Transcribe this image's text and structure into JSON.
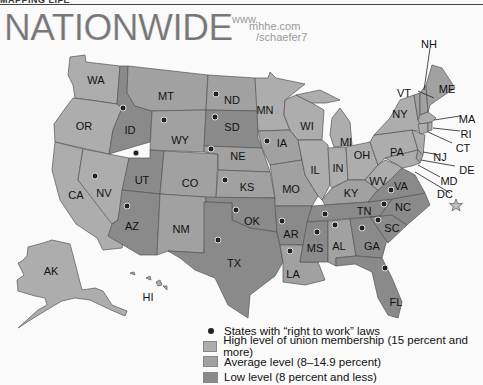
{
  "header": {
    "section_label": "MAPPING LIFE",
    "title": "NATIONWIDE",
    "url_line1": "www.",
    "url_line2": "mhhe.com",
    "url_line3": "/schaefer7"
  },
  "colors": {
    "high": "#adadad",
    "average": "#a1a1a1",
    "low": "#8a8a8a",
    "right_to_work_dot": "#222222"
  },
  "states": {
    "WA": {
      "label": "WA",
      "level": "high",
      "rtw": false
    },
    "OR": {
      "label": "OR",
      "level": "high",
      "rtw": false
    },
    "CA": {
      "label": "CA",
      "level": "high",
      "rtw": false
    },
    "NV": {
      "label": "NV",
      "level": "high",
      "rtw": true
    },
    "ID": {
      "label": "ID",
      "level": "low",
      "rtw": true
    },
    "MT": {
      "label": "MT",
      "level": "average",
      "rtw": false
    },
    "WY": {
      "label": "WY",
      "level": "average",
      "rtw": true
    },
    "UT": {
      "label": "UT",
      "level": "low",
      "rtw": true
    },
    "AZ": {
      "label": "AZ",
      "level": "low",
      "rtw": true
    },
    "CO": {
      "label": "CO",
      "level": "average",
      "rtw": false
    },
    "NM": {
      "label": "NM",
      "level": "average",
      "rtw": false
    },
    "ND": {
      "label": "ND",
      "level": "average",
      "rtw": true
    },
    "SD": {
      "label": "SD",
      "level": "low",
      "rtw": true
    },
    "NE": {
      "label": "NE",
      "level": "average",
      "rtw": true
    },
    "KS": {
      "label": "KS",
      "level": "average",
      "rtw": true
    },
    "OK": {
      "label": "OK",
      "level": "low",
      "rtw": true
    },
    "TX": {
      "label": "TX",
      "level": "low",
      "rtw": true
    },
    "MN": {
      "label": "MN",
      "level": "high",
      "rtw": false
    },
    "IA": {
      "label": "IA",
      "level": "average",
      "rtw": true
    },
    "MO": {
      "label": "MO",
      "level": "average",
      "rtw": false
    },
    "AR": {
      "label": "AR",
      "level": "low",
      "rtw": true
    },
    "LA": {
      "label": "LA",
      "level": "average",
      "rtw": true
    },
    "WI": {
      "label": "WI",
      "level": "high",
      "rtw": false
    },
    "IL": {
      "label": "IL",
      "level": "high",
      "rtw": false
    },
    "MI": {
      "label": "MI",
      "level": "high",
      "rtw": false
    },
    "IN": {
      "label": "IN",
      "level": "high",
      "rtw": false
    },
    "OH": {
      "label": "OH",
      "level": "high",
      "rtw": false
    },
    "KY": {
      "label": "KY",
      "level": "average",
      "rtw": false
    },
    "TN": {
      "label": "TN",
      "level": "low",
      "rtw": true
    },
    "MS": {
      "label": "MS",
      "level": "low",
      "rtw": true
    },
    "AL": {
      "label": "AL",
      "level": "average",
      "rtw": true
    },
    "GA": {
      "label": "GA",
      "level": "low",
      "rtw": true
    },
    "FL": {
      "label": "FL",
      "level": "low",
      "rtw": true
    },
    "SC": {
      "label": "SC",
      "level": "low",
      "rtw": true
    },
    "NC": {
      "label": "NC",
      "level": "low",
      "rtw": true
    },
    "VA": {
      "label": "VA",
      "level": "low",
      "rtw": true
    },
    "WV": {
      "label": "WV",
      "level": "high",
      "rtw": false
    },
    "PA": {
      "label": "PA",
      "level": "high",
      "rtw": false
    },
    "NY": {
      "label": "NY",
      "level": "high",
      "rtw": false
    },
    "VT": {
      "label": "VT",
      "level": "average",
      "rtw": false
    },
    "NH": {
      "label": "NH",
      "level": "average",
      "rtw": false
    },
    "ME": {
      "label": "ME",
      "level": "average",
      "rtw": false
    },
    "MA": {
      "label": "MA",
      "level": "high",
      "rtw": false
    },
    "RI": {
      "label": "RI",
      "level": "high",
      "rtw": false
    },
    "CT": {
      "label": "CT",
      "level": "high",
      "rtw": false
    },
    "NJ": {
      "label": "NJ",
      "level": "high",
      "rtw": false
    },
    "DE": {
      "label": "DE",
      "level": "average",
      "rtw": false
    },
    "MD": {
      "label": "MD",
      "level": "high",
      "rtw": false
    },
    "DC": {
      "label": "DC",
      "level": "",
      "rtw": false
    },
    "AK": {
      "label": "AK",
      "level": "high",
      "rtw": false
    },
    "HI": {
      "label": "HI",
      "level": "high",
      "rtw": false
    }
  },
  "legend": {
    "items": [
      {
        "kind": "dot",
        "label": "States with “right to work” laws"
      },
      {
        "kind": "high",
        "label": "High level of union membership (15 percent and more)"
      },
      {
        "kind": "average",
        "label": "Average level (8–14.9 percent)"
      },
      {
        "kind": "low",
        "label": "Low level (8 percent and less)"
      }
    ]
  }
}
